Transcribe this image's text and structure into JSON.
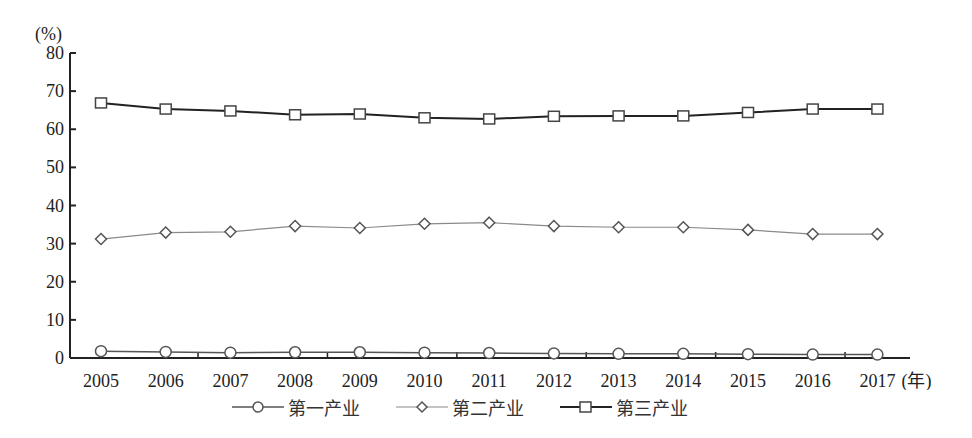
{
  "chart_data": {
    "type": "line",
    "title": "",
    "xlabel": "(年)",
    "ylabel": "(%)",
    "ylim": [
      0,
      80
    ],
    "yticks": [
      0,
      10,
      20,
      30,
      40,
      50,
      60,
      70,
      80
    ],
    "grid": false,
    "legend_position": "bottom",
    "categories": [
      "2005",
      "2006",
      "2007",
      "2008",
      "2009",
      "2010",
      "2011",
      "2012",
      "2013",
      "2014",
      "2015",
      "2016",
      "2017"
    ],
    "series": [
      {
        "name": "第一产业",
        "marker": "circle",
        "color": "#555555",
        "values": [
          1.8,
          1.6,
          1.4,
          1.5,
          1.5,
          1.4,
          1.3,
          1.2,
          1.1,
          1.1,
          1.0,
          0.9,
          0.9
        ]
      },
      {
        "name": "第二产业",
        "marker": "diamond",
        "color": "#8a8a8a",
        "values": [
          31.2,
          32.9,
          33.1,
          34.6,
          34.1,
          35.2,
          35.5,
          34.6,
          34.3,
          34.3,
          33.6,
          32.5,
          32.5
        ]
      },
      {
        "name": "第三产业",
        "marker": "square",
        "color": "#222222",
        "values": [
          66.9,
          65.3,
          64.8,
          63.8,
          64.0,
          63.0,
          62.7,
          63.4,
          63.5,
          63.5,
          64.4,
          65.3,
          65.3
        ]
      }
    ]
  },
  "axis": {
    "y_unit": "(%)",
    "x_unit": "(年)"
  },
  "legend": {
    "items": [
      "第一产业",
      "第二产业",
      "第三产业"
    ]
  }
}
